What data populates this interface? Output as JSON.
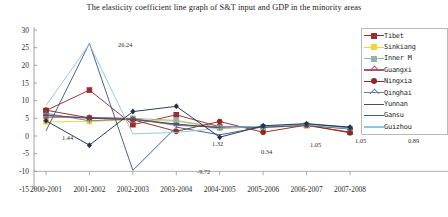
{
  "chart_data": {
    "type": "line",
    "title": "The elasticity coefficient line graph of S&T input and GDP in the minority areas",
    "xlabel": "",
    "ylabel": "",
    "ylim": [
      -15,
      30
    ],
    "yticks": [
      30,
      25,
      20,
      15,
      10,
      5,
      0,
      -5,
      -10,
      -15
    ],
    "grid": false,
    "legend_position": "right",
    "categories": [
      "2000-2001",
      "2001-2002",
      "2002-2003",
      "2003-2004",
      "2004-2005",
      "2005-2006",
      "2006-2007",
      "2007-2008"
    ],
    "series": [
      {
        "name": "Tibet",
        "color": "#9b2d30",
        "marker": "square",
        "values": [
          7.2,
          13.0,
          3.2,
          6.0,
          2.6,
          2.4,
          3.0,
          1.1
        ]
      },
      {
        "name": "Sinkiang",
        "color": "#f2d53c",
        "marker": "square",
        "values": [
          4.0,
          4.1,
          4.6,
          4.2,
          2.2,
          2.5,
          2.9,
          2.0
        ]
      },
      {
        "name": "Inner M",
        "color": "#8fb7a8",
        "marker": "square",
        "values": [
          5.6,
          5.2,
          5.0,
          4.4,
          2.4,
          2.6,
          3.0,
          2.1
        ]
      },
      {
        "name": "Guangxi",
        "color": "#b0526a",
        "marker": "star",
        "values": [
          5.3,
          5.3,
          4.9,
          3.2,
          2.4,
          2.6,
          3.1,
          2.2
        ]
      },
      {
        "name": "Ningxia",
        "color": "#8e2a21",
        "marker": "circle",
        "values": [
          7.3,
          5.1,
          4.6,
          1.32,
          4.1,
          1.05,
          3.1,
          0.89
        ]
      },
      {
        "name": "Qinghai",
        "color": "#6d7f98",
        "marker": "plus",
        "values": [
          6.4,
          4.3,
          4.8,
          3.0,
          2.5,
          2.7,
          3.2,
          2.3
        ]
      },
      {
        "name": "Yunnan",
        "color": "#4b4b64",
        "marker": "dash",
        "values": [
          5.9,
          5.0,
          4.7,
          3.4,
          2.3,
          2.5,
          3.0,
          2.0
        ]
      },
      {
        "name": "Gansu",
        "color": "#3f5b8c",
        "marker": "line",
        "values": [
          1.44,
          26.24,
          -9.72,
          2.5,
          0.34,
          2.6,
          3.4,
          2.4
        ]
      },
      {
        "name": "Guizhou",
        "color": "#8ec6e0",
        "marker": "line",
        "values": [
          8.6,
          26.0,
          0.6,
          1.0,
          2.2,
          2.8,
          3.2,
          2.1
        ]
      },
      {
        "name": "Dark",
        "color": "#22344d",
        "marker": "diamond",
        "values": [
          4.3,
          -2.6,
          6.9,
          8.4,
          -0.34,
          2.9,
          3.5,
          2.5
        ]
      }
    ],
    "point_labels": [
      {
        "text": "1.44",
        "x": 62,
        "y": 140
      },
      {
        "text": "26.24",
        "x": 118,
        "y": 47
      },
      {
        "text": "-9.72",
        "x": 197,
        "y": 174
      },
      {
        "text": "1.32",
        "x": 212,
        "y": 146
      },
      {
        "text": "0.34",
        "x": 261,
        "y": 154
      },
      {
        "text": "1.05",
        "x": 310,
        "y": 147
      },
      {
        "text": "1.05",
        "x": 355,
        "y": 143
      },
      {
        "text": "0.89",
        "x": 408,
        "y": 143
      }
    ]
  },
  "legend": {
    "items": [
      {
        "label": "Tibet"
      },
      {
        "label": "Sinkiang"
      },
      {
        "label": "Inner  M"
      },
      {
        "label": "Guangxi"
      },
      {
        "label": "Ningxia"
      },
      {
        "label": "Qinghai"
      },
      {
        "label": "Yunnan"
      },
      {
        "label": "Gansu"
      },
      {
        "label": "Guizhou"
      }
    ]
  }
}
